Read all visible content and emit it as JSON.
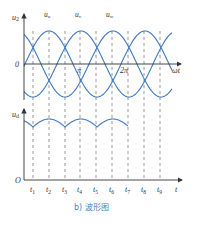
{
  "diagram": {
    "caption": "b) 波形图",
    "top_plot": {
      "y_label": "u",
      "y_label_sub": "2",
      "x_label": "ωt",
      "origin_label": "0",
      "tick_labels": [
        "π",
        "2π"
      ],
      "curves": [
        {
          "label": "u",
          "sub": "u",
          "name": "phase-u"
        },
        {
          "label": "u",
          "sub": "v",
          "name": "phase-v"
        },
        {
          "label": "u",
          "sub": "w",
          "name": "phase-w"
        }
      ]
    },
    "bottom_plot": {
      "y_label": "u",
      "y_label_sub": "d",
      "x_label": "t",
      "origin_label": "O",
      "time_ticks": [
        {
          "t": "t",
          "s": "1"
        },
        {
          "t": "t",
          "s": "2"
        },
        {
          "t": "t",
          "s": "3"
        },
        {
          "t": "t",
          "s": "4"
        },
        {
          "t": "t",
          "s": "5"
        },
        {
          "t": "t",
          "s": "6"
        },
        {
          "t": "t",
          "s": "7"
        },
        {
          "t": "t",
          "s": "8"
        },
        {
          "t": "t",
          "s": "9"
        }
      ]
    },
    "colors": {
      "wave": "#3d7bbf",
      "axis": "#333333",
      "dash": "#555555",
      "caption": "#4a7fc1"
    }
  }
}
